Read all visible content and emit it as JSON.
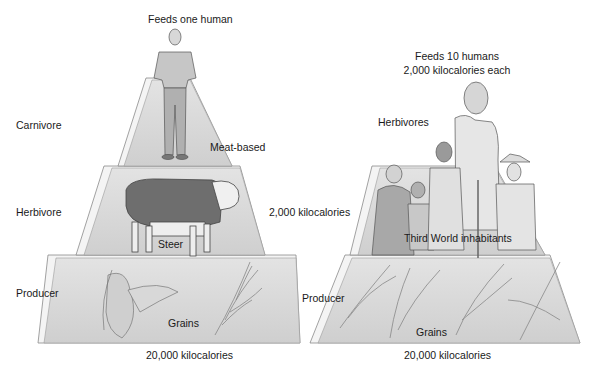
{
  "left_pyramid": {
    "top_caption": "Feeds one human",
    "tiers": [
      {
        "level_label": "Carnivore",
        "side_label": "Meat-based",
        "figure": "human"
      },
      {
        "level_label": "Herbivore",
        "inner_label": "Steer",
        "figure": "steer"
      },
      {
        "level_label": "Producer",
        "inner_label": "Grains",
        "figure": "corn-and-wheat"
      }
    ],
    "energy_middle": "2,000 kilocalories",
    "bottom_caption": "20,000 kilocalories"
  },
  "right_pyramid": {
    "top_caption_line1": "Feeds 10 humans",
    "top_caption_line2": "2,000 kilocalories each",
    "tiers": [
      {
        "level_label": "Herbivores",
        "inner_label": "Third World inhabitants",
        "figure": "people-group"
      },
      {
        "level_label": "Producer",
        "inner_label": "Grains",
        "figure": "grain-stalks"
      }
    ],
    "bottom_caption": "20,000 kilocalories"
  },
  "colors": {
    "tier_fill": "#d9d9d9",
    "tier_edge": "#f2f2f2",
    "outline": "#8a8a8a",
    "steer_body": "#6e6e6e",
    "text": "#1a1a1a"
  }
}
